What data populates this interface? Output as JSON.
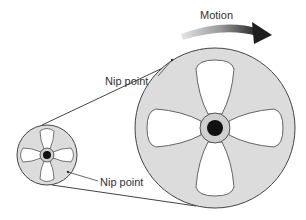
{
  "diagram": {
    "labels": {
      "motion": "Motion",
      "nip_top": "Nip point",
      "nip_bottom": "Nip point"
    },
    "colors": {
      "wheel_fill": "#dcdcdc",
      "stroke": "#444444",
      "hub": "#111111",
      "arrow_dark": "#2a2a2a",
      "arrow_light": "#bdbdbd"
    },
    "pulleys": [
      {
        "name": "small-pulley",
        "cx": 47,
        "cy": 155,
        "r": 30
      },
      {
        "name": "large-pulley",
        "cx": 215,
        "cy": 128,
        "r": 80
      }
    ]
  }
}
